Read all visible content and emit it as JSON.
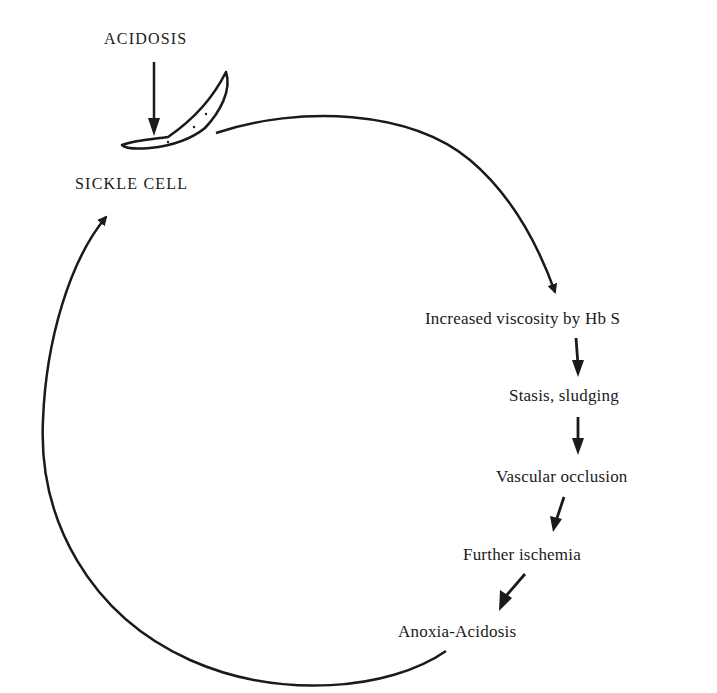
{
  "diagram": {
    "type": "cycle",
    "trigger": {
      "label": "ACIDOSIS"
    },
    "start_node": {
      "label": "SICKLE CELL",
      "icon": "sickle-cell-icon"
    },
    "steps": [
      {
        "label": "Increased viscosity by Hb S"
      },
      {
        "label": "Stasis, sludging"
      },
      {
        "label": "Vascular occlusion"
      },
      {
        "label": "Further ischemia"
      },
      {
        "label": "Anoxia-Acidosis"
      }
    ],
    "colors": {
      "ink": "#1a1a1a",
      "background": "#ffffff"
    }
  }
}
